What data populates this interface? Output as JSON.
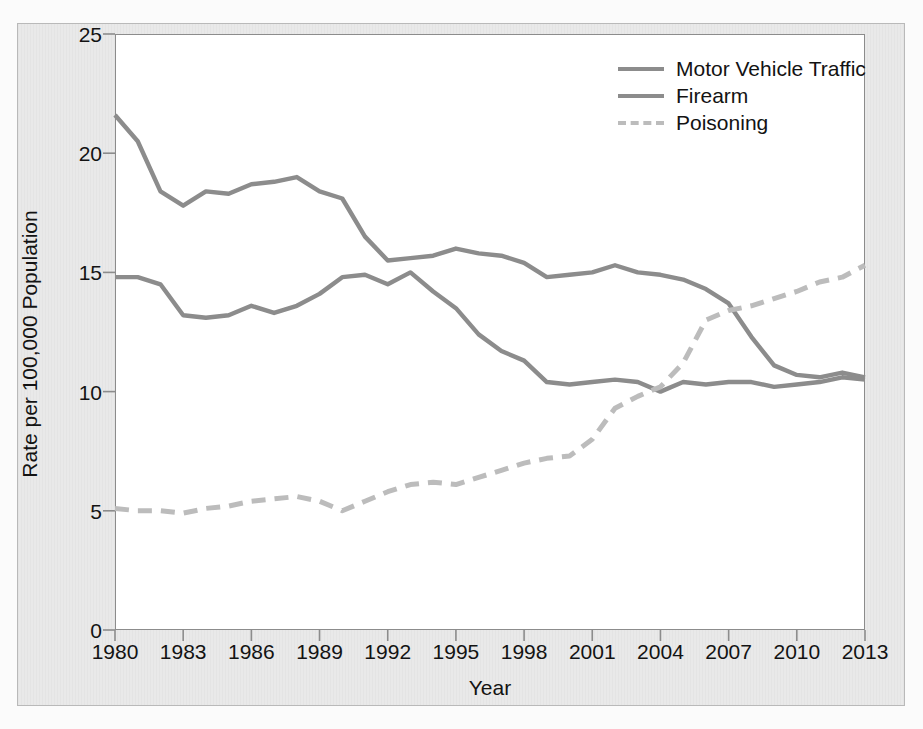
{
  "chart_data": {
    "type": "line",
    "title": "",
    "xlabel": "Year",
    "ylabel": "Rate per 100,000 Population",
    "xlim": [
      1980,
      2013
    ],
    "ylim": [
      0,
      25
    ],
    "yticks": [
      0,
      5,
      10,
      15,
      20,
      25
    ],
    "xticks": [
      1980,
      1983,
      1986,
      1989,
      1992,
      1995,
      1998,
      2001,
      2004,
      2007,
      2010,
      2013
    ],
    "grid": false,
    "legend_position": "top-right",
    "x": [
      1980,
      1981,
      1982,
      1983,
      1984,
      1985,
      1986,
      1987,
      1988,
      1989,
      1990,
      1991,
      1992,
      1993,
      1994,
      1995,
      1996,
      1997,
      1998,
      1999,
      2000,
      2001,
      2002,
      2003,
      2004,
      2005,
      2006,
      2007,
      2008,
      2009,
      2010,
      2011,
      2012,
      2013
    ],
    "series": [
      {
        "name": "Motor Vehicle Traffic",
        "style": "solid",
        "color": "#8c8c8c",
        "values": [
          21.6,
          20.5,
          18.4,
          17.8,
          18.4,
          18.3,
          18.7,
          18.8,
          19.0,
          18.4,
          18.1,
          16.5,
          15.5,
          15.6,
          15.7,
          16.0,
          15.8,
          15.7,
          15.4,
          14.8,
          14.9,
          15.0,
          15.3,
          15.0,
          14.9,
          14.7,
          14.3,
          13.7,
          12.3,
          11.1,
          10.7,
          10.6,
          10.8,
          10.6
        ]
      },
      {
        "name": "Firearm",
        "style": "solid",
        "color": "#8c8c8c",
        "values": [
          14.8,
          14.8,
          14.5,
          13.2,
          13.1,
          13.2,
          13.6,
          13.3,
          13.6,
          14.1,
          14.8,
          14.9,
          14.5,
          15.0,
          14.2,
          13.5,
          12.4,
          11.7,
          11.3,
          10.4,
          10.3,
          10.4,
          10.5,
          10.4,
          10.0,
          10.4,
          10.3,
          10.4,
          10.4,
          10.2,
          10.3,
          10.4,
          10.6,
          10.5
        ]
      },
      {
        "name": "Poisoning",
        "style": "dashed",
        "color": "#bcbcbc",
        "values": [
          5.1,
          5.0,
          5.0,
          4.9,
          5.1,
          5.2,
          5.4,
          5.5,
          5.6,
          5.4,
          5.0,
          5.4,
          5.8,
          6.1,
          6.2,
          6.1,
          6.4,
          6.7,
          7.0,
          7.2,
          7.3,
          8.0,
          9.3,
          9.8,
          10.2,
          11.2,
          13.0,
          13.4,
          13.6,
          13.9,
          14.2,
          14.6,
          14.8,
          15.3
        ]
      }
    ],
    "legend": [
      "Motor Vehicle Traffic",
      "Firearm",
      "Poisoning"
    ]
  },
  "axes": {
    "y_axis_title": "Rate per 100,000 Population",
    "x_axis_title": "Year",
    "y_tick_labels": [
      "25",
      "20",
      "15",
      "10",
      "5",
      "0"
    ],
    "x_tick_labels": [
      "1980",
      "1983",
      "1986",
      "1989",
      "1992",
      "1995",
      "1998",
      "2001",
      "2004",
      "2007",
      "2010",
      "2013"
    ]
  },
  "legend": {
    "items": [
      {
        "label": "Motor Vehicle Traffic",
        "style": "solid",
        "color": "#8c8c8c"
      },
      {
        "label": "Firearm",
        "style": "solid",
        "color": "#8c8c8c"
      },
      {
        "label": "Poisoning",
        "style": "dashed",
        "color": "#bcbcbc"
      }
    ]
  },
  "colors": {
    "page_background": "#fbfbfb",
    "card_background": "#e9e9e9",
    "plot_background": "#ffffff",
    "axis": "#8c8c8c",
    "text": "#131313",
    "line_solid": "#8c8c8c",
    "line_dashed": "#bcbcbc"
  }
}
